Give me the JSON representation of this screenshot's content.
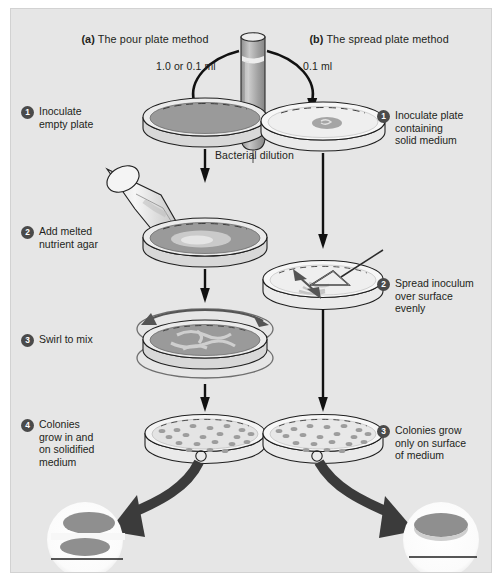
{
  "figure": {
    "background_color": "#e6e6e6",
    "border_color": "#d2d2d2",
    "text_color": "#231f20",
    "badge_color": "#4a4a4a",
    "medium_dark": "#9a9a9a",
    "medium_light": "#f2f2f2",
    "colony_color": "#9d9d9d",
    "arrow_color": "#1a1a1a"
  },
  "panels": {
    "left": {
      "tag": "(a)",
      "title": "The pour plate method"
    },
    "right": {
      "tag": "(b)",
      "title": "The spread plate method"
    }
  },
  "tube": {
    "label": "Bacterial dilution"
  },
  "volumes": {
    "left": "1.0 or 0.1 ml",
    "right": "0.1 ml"
  },
  "left_steps": [
    {
      "num": "1",
      "label": "Inoculate\nempty plate"
    },
    {
      "num": "2",
      "label": "Add melted\nnutrient agar"
    },
    {
      "num": "3",
      "label": "Swirl to mix"
    },
    {
      "num": "4",
      "label": "Colonies\ngrow in and\non solidified\nmedium"
    }
  ],
  "right_steps": [
    {
      "num": "1",
      "label": "Inoculate plate\ncontaining\nsolid medium"
    },
    {
      "num": "2",
      "label": "Spread inoculum\nover surface\nevenly"
    },
    {
      "num": "3",
      "label": "Colonies grow\nonly on surface\nof medium"
    }
  ],
  "insets": {
    "left": {
      "name": "colonies-in-and-on-medium"
    },
    "right": {
      "name": "colonies-on-surface-only"
    }
  }
}
